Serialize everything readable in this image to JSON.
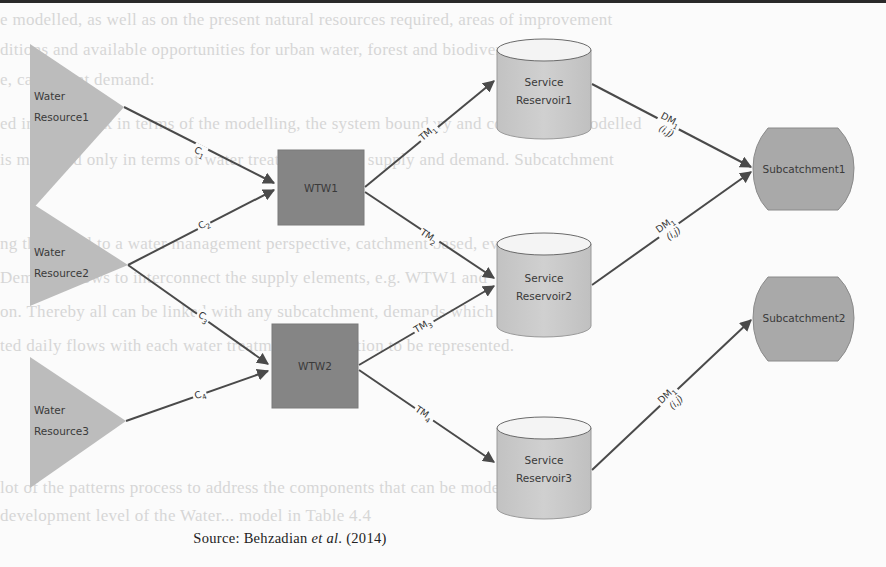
{
  "background_text": [
    "e modelled, as well as on the present natural resources required, areas of improvement",
    "ditions and available opportunities for urban water, forest and biodiversity in the",
    "e, catchment demand:",
    "ed in Figure 2.x in terms of the modelling, the system boundary and components modelled",
    "is modelled only in terms of water treatment, water supply and demand. Subcatchment",
    "ng the model to a water management perspective, catchment based, evaluation.",
    "Demand allows to interconnect the supply elements, e.g. WTW1 and",
    "on. Thereby all can be linked with any subcatchment, demands which",
    "ted daily flows with each water treatment intervention to be represented.",
    "lot of the patterns process to address the components that can be modelled at",
    "development level of the Water... model in Table 4.4"
  ],
  "diagram": {
    "water_resources": [
      {
        "id": "wr1",
        "label_line1": "Water",
        "label_line2": "Resource1"
      },
      {
        "id": "wr2",
        "label_line1": "Water",
        "label_line2": "Resource2"
      },
      {
        "id": "wr3",
        "label_line1": "Water",
        "label_line2": "Resource3"
      }
    ],
    "treatment_works": [
      {
        "id": "wtw1",
        "label": "WTW1"
      },
      {
        "id": "wtw2",
        "label": "WTW2"
      }
    ],
    "service_reservoirs": [
      {
        "id": "sr1",
        "label_line1": "Service",
        "label_line2": "Reservoir1"
      },
      {
        "id": "sr2",
        "label_line1": "Service",
        "label_line2": "Reservoir2"
      },
      {
        "id": "sr3",
        "label_line1": "Service",
        "label_line2": "Reservoir3"
      }
    ],
    "subcatchments": [
      {
        "id": "sc1",
        "label": "Subcatchment1"
      },
      {
        "id": "sc2",
        "label": "Subcatchment2"
      }
    ],
    "edges": [
      {
        "from": "wr1",
        "to": "wtw1",
        "label": "C",
        "sub": "1"
      },
      {
        "from": "wr2",
        "to": "wtw1",
        "label": "C",
        "sub": "2"
      },
      {
        "from": "wr2",
        "to": "wtw2",
        "label": "C",
        "sub": "3"
      },
      {
        "from": "wr3",
        "to": "wtw2",
        "label": "C",
        "sub": "4"
      },
      {
        "from": "wtw1",
        "to": "sr1",
        "label": "TM",
        "sub": "1"
      },
      {
        "from": "wtw1",
        "to": "sr2",
        "label": "TM",
        "sub": "2"
      },
      {
        "from": "wtw2",
        "to": "sr2",
        "label": "TM",
        "sub": "3"
      },
      {
        "from": "wtw2",
        "to": "sr3",
        "label": "TM",
        "sub": "4"
      },
      {
        "from": "sr1",
        "to": "sc1",
        "label": "DM",
        "sub": "1",
        "index": "(i,j)"
      },
      {
        "from": "sr2",
        "to": "sc1",
        "label": "DM",
        "sub": "1",
        "index": "(i,j)"
      },
      {
        "from": "sr3",
        "to": "sc2",
        "label": "DM",
        "sub": "1",
        "index": "(i,j)"
      }
    ],
    "colors": {
      "water_resource": "#bcbcbc",
      "treatment_works": "#858585",
      "service_reservoir": "#cbcbcb",
      "subcatchment": "#a9a9a9",
      "edge": "#4a4a4a"
    }
  },
  "caption": {
    "prefix": "Source: Behzadian ",
    "italic": "et al",
    "suffix": ". (2014)"
  }
}
